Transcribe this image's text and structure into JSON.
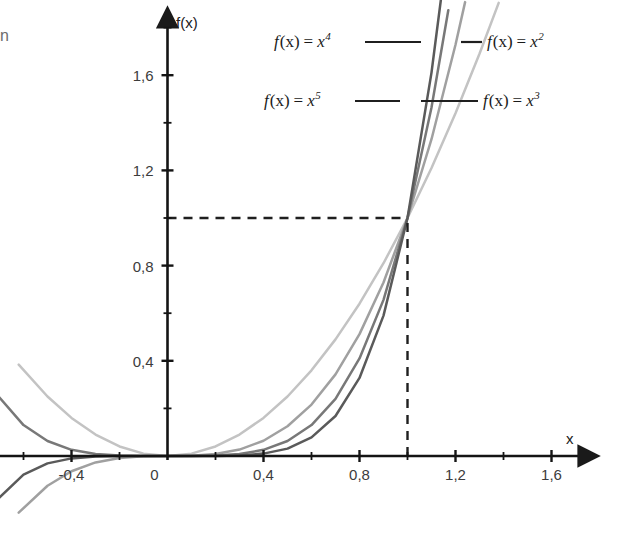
{
  "figure": {
    "edge_artifact_text": "n",
    "axis": {
      "x_name": "x",
      "y_name": "f(x)",
      "x_ticks": [
        {
          "value": -0.4,
          "label": "-0,4"
        },
        {
          "value": 0,
          "label": "0"
        },
        {
          "value": 0.4,
          "label": "0,4"
        },
        {
          "value": 0.8,
          "label": "0,8"
        },
        {
          "value": 1.2,
          "label": "1,2"
        },
        {
          "value": 1.6,
          "label": "1,6"
        }
      ],
      "y_ticks": [
        {
          "value": 0.4,
          "label": "0,4"
        },
        {
          "value": 0.8,
          "label": "0,8"
        },
        {
          "value": 1.2,
          "label": "1,2"
        },
        {
          "value": 1.6,
          "label": "1,6"
        }
      ]
    },
    "legend": {
      "items": [
        {
          "id": "x4",
          "prefix": "f",
          "arg": "(x)",
          "eq": "=",
          "base": "x",
          "exp": "4",
          "label": "f(x) = x⁴",
          "position": "top-left"
        },
        {
          "id": "x2",
          "prefix": "f",
          "arg": "(x)",
          "eq": "=",
          "base": "x",
          "exp": "2",
          "label": "f(x) = x²",
          "position": "top-right"
        },
        {
          "id": "x5",
          "prefix": "f",
          "arg": "(x)",
          "eq": "=",
          "base": "x",
          "exp": "5",
          "label": "f(x) = x⁵",
          "position": "bottom-left"
        },
        {
          "id": "x3",
          "prefix": "f",
          "arg": "(x)",
          "eq": "=",
          "base": "x",
          "exp": "3",
          "label": "f(x) = x³",
          "position": "bottom-right"
        }
      ]
    },
    "guides": {
      "horizontal_label": "f(x) = 1 guide",
      "vertical_label": "x = 1 guide",
      "intersection_x": 1,
      "intersection_y": 1
    }
  },
  "chart_data": {
    "type": "line",
    "title": "",
    "xlabel": "x",
    "ylabel": "f(x)",
    "xlim": [
      -0.7,
      1.77
    ],
    "ylim": [
      -0.35,
      1.9
    ],
    "grid": false,
    "legend_position": "top-inside",
    "x_ticks": [
      -0.4,
      0,
      0.4,
      0.8,
      1.2,
      1.6
    ],
    "x_tick_labels": [
      "-0,4",
      "0",
      "0,4",
      "0,8",
      "1,2",
      "1,6"
    ],
    "x_minor_tick_step": 0.2,
    "y_ticks": [
      0.4,
      0.8,
      1.2,
      1.6
    ],
    "y_tick_labels": [
      "0,4",
      "0,8",
      "1,2",
      "1,6"
    ],
    "y_minor_tick_step": 0.2,
    "annotations": [
      {
        "type": "dashed-line",
        "orientation": "horizontal",
        "y": 1,
        "x_from": 0,
        "x_to": 1
      },
      {
        "type": "dashed-line",
        "orientation": "vertical",
        "x": 1,
        "y_from": 0,
        "y_to": 1
      },
      {
        "type": "point",
        "x": 1,
        "y": 1,
        "note": "all curves intersect"
      }
    ],
    "series": [
      {
        "name": "f(x) = x²",
        "exponent": 2,
        "color": "#c3c3c3",
        "x": [
          -0.62,
          -0.5,
          -0.4,
          -0.3,
          -0.2,
          -0.1,
          0,
          0.1,
          0.2,
          0.3,
          0.4,
          0.5,
          0.6,
          0.7,
          0.8,
          0.9,
          1.0,
          1.1,
          1.2,
          1.3,
          1.38
        ],
        "y": [
          0.384,
          0.25,
          0.16,
          0.09,
          0.04,
          0.01,
          0,
          0.01,
          0.04,
          0.09,
          0.16,
          0.25,
          0.36,
          0.49,
          0.64,
          0.81,
          1.0,
          1.21,
          1.44,
          1.69,
          1.904
        ]
      },
      {
        "name": "f(x) = x³",
        "exponent": 3,
        "color": "#a0a0a0",
        "x": [
          -0.62,
          -0.5,
          -0.4,
          -0.3,
          -0.2,
          -0.1,
          0,
          0.1,
          0.2,
          0.3,
          0.4,
          0.5,
          0.6,
          0.7,
          0.8,
          0.9,
          1.0,
          1.1,
          1.2,
          1.24
        ],
        "y": [
          -0.238,
          -0.125,
          -0.064,
          -0.027,
          -0.008,
          -0.001,
          0,
          0.001,
          0.008,
          0.027,
          0.064,
          0.125,
          0.216,
          0.343,
          0.512,
          0.729,
          1.0,
          1.331,
          1.728,
          1.907
        ]
      },
      {
        "name": "f(x) = x⁴",
        "exponent": 4,
        "color": "#787878",
        "x": [
          -0.72,
          -0.6,
          -0.5,
          -0.4,
          -0.3,
          -0.2,
          -0.1,
          0,
          0.1,
          0.2,
          0.3,
          0.4,
          0.5,
          0.6,
          0.7,
          0.8,
          0.9,
          1.0,
          1.1,
          1.17
        ],
        "y": [
          0.269,
          0.13,
          0.063,
          0.026,
          0.008,
          0.002,
          0.0001,
          0,
          0.0001,
          0.002,
          0.008,
          0.026,
          0.063,
          0.13,
          0.24,
          0.41,
          0.656,
          1.0,
          1.464,
          1.873
        ]
      },
      {
        "name": "f(x) = x⁵",
        "exponent": 5,
        "color": "#5a5a5a",
        "x": [
          -0.72,
          -0.6,
          -0.5,
          -0.4,
          -0.3,
          -0.2,
          -0.1,
          0,
          0.1,
          0.2,
          0.3,
          0.4,
          0.5,
          0.6,
          0.7,
          0.8,
          0.9,
          1.0,
          1.1,
          1.14
        ],
        "y": [
          -0.194,
          -0.078,
          -0.031,
          -0.01,
          -0.002,
          -0.0003,
          0,
          0,
          0,
          0.0003,
          0.002,
          0.01,
          0.031,
          0.078,
          0.168,
          0.328,
          0.59,
          1.0,
          1.611,
          1.924
        ]
      }
    ]
  }
}
